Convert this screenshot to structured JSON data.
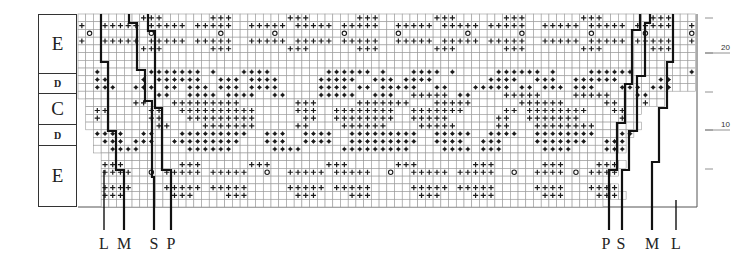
{
  "diagram": {
    "type": "knitting-chart",
    "cell_size": 7.72,
    "origin": {
      "x": 78,
      "y": 14
    },
    "colors": {
      "grid": "#9a9a9a",
      "ink": "#1a1a1a",
      "frame": "#555555"
    },
    "legend_symbols": {
      "+": "cross-stitch",
      "*": "dot-stitch",
      "o": "circle-stitch",
      ".": "empty-cell"
    },
    "sections": [
      {
        "label": "E",
        "size": "big",
        "top": 14,
        "height": 59
      },
      {
        "label": "D",
        "size": "small",
        "top": 73,
        "height": 20
      },
      {
        "label": "C",
        "size": "big",
        "top": 93,
        "height": 31
      },
      {
        "label": "D",
        "size": "small",
        "top": 124,
        "height": 21
      },
      {
        "label": "E",
        "size": "big",
        "top": 145,
        "height": 62,
        "last": true
      }
    ],
    "row_numbers": [
      {
        "label": "20",
        "y": 53
      },
      {
        "label": "10",
        "y": 130
      }
    ],
    "row_ticks": [
      18,
      53,
      92,
      130,
      169
    ],
    "size_markers_left": [
      {
        "label": "L",
        "x": 104
      },
      {
        "label": "M",
        "x": 124
      },
      {
        "label": "S",
        "x": 154
      },
      {
        "label": "P",
        "x": 171
      }
    ],
    "size_markers_right": [
      {
        "label": "P",
        "x": 606
      },
      {
        "label": "S",
        "x": 621
      },
      {
        "label": "M",
        "x": 652
      },
      {
        "label": "L",
        "x": 676
      }
    ],
    "rows": [
      {
        "start": 0,
        "cells": "........+++......+++.......+++......+++.......+++......+++.......+++......+++....."
      },
      {
        "start": 0,
        "cells": "+..+++++.+++++.+++++..+++++.+++++.+++++..+++++.+++++.+++++..+++++.+++++.+++++..+."
      },
      {
        "start": 0,
        "cells": ".o.......o........o......o........o......o........o......o........o......o.....o."
      },
      {
        "start": 0,
        "cells": "+..+++++.+++++.+++++..+++++.+++++.+++++..+++++.+++++.+++++..+++++.+++++.+++++..+."
      },
      {
        "start": 0,
        "cells": "........+++......+++.......+++......+++.......+++......+++.......+++......+++....."
      },
      {
        "start": 0,
        "cells": "................................................................................"
      },
      {
        "start": 0,
        "cells": "................................................................................"
      },
      {
        "start": 0,
        "cells": "..*......*******.*...****.......******.*...****.*.....******.*....******.......*."
      },
      {
        "start": 0,
        "cells": "..**....*.******..***.****.....*****..***.****.......****..***..******.....**...*"
      },
      {
        "start": 0,
        "cells": "..***..***.**.***.***.****.....****.**.*****..**...*****.**.***.***...***.***..."
      },
      {
        "start": 0,
        "cells": "..........**..****.****..**....*****..***..+++++.**....+++++....+++++...**.."
      },
      {
        "start": 1,
        "cells": "......++...+++++++++.......+++.....+++++++...+++++......++++++.....++...+.."
      },
      {
        "start": 1,
        "cells": ".++.....++..++++++++++.....+++..++++++++..+++++++.....++.++++++++...++.."
      },
      {
        "start": 1,
        "cells": ".+......++...+++++++++......++..++++++++..+++++......++..+++++++.....+."
      },
      {
        "start": 1,
        "cells": ".........++....+++++++.....++....++++++....+++++.....++...++++++++......"
      },
      {
        "start": 2,
        "cells": "****..**...*********..***..****..*********..*****..****..********...**"
      },
      {
        "start": 2,
        "cells": ".***.***..*********...***..****..*********..****..***....*******..***"
      },
      {
        "start": 2,
        "cells": "..****......******.....****.....*********....****.***.....****....***"
      },
      {
        "start": 3,
        "cells": "................................................................."
      },
      {
        "start": 3,
        "cells": "+++.......+++......+++.......+++......+++.......+++......+++....+++."
      },
      {
        "start": 3,
        "cells": "++++..o.+++++.+++++..o..+++++.+++++..o..+++++.+++++..o..++++.o.++++"
      },
      {
        "start": 3,
        "cells": "................................................................."
      },
      {
        "start": 3,
        "cells": "++++....+++++.+++++.....+++++.+++++.....+++++.+++++.....++++...++++"
      },
      {
        "start": 3,
        "cells": "+++......+++....+++......+++....+++......+++....+++......+++....+++."
      },
      {
        "start": 3,
        "cells": "................................................................."
      }
    ],
    "frame": {
      "x1": 78,
      "y1": 14,
      "x2": 697,
      "y2": 207,
      "bottom_right_y": 207
    },
    "size_lines": [
      {
        "points": [
          [
            101,
            14
          ],
          [
            101,
            62
          ],
          [
            108,
            62
          ],
          [
            108,
            131
          ],
          [
            116,
            131
          ],
          [
            116,
            170
          ],
          [
            124,
            170
          ],
          [
            124,
            230
          ]
        ],
        "width": 2.2,
        "ext_label": "M"
      },
      {
        "points": [
          [
            129,
            14
          ],
          [
            129,
            23
          ],
          [
            137,
            23
          ],
          [
            137,
            70
          ],
          [
            145,
            70
          ],
          [
            145,
            101
          ],
          [
            152,
            101
          ],
          [
            152,
            177
          ],
          [
            154,
            177
          ],
          [
            154,
            230
          ]
        ],
        "width": 2.2
      },
      {
        "points": [
          [
            148,
            14
          ],
          [
            148,
            31
          ],
          [
            155,
            31
          ],
          [
            155,
            108
          ],
          [
            162,
            108
          ],
          [
            162,
            170
          ],
          [
            171,
            170
          ],
          [
            171,
            230
          ]
        ],
        "width": 2.2
      },
      {
        "points": [
          [
            104,
            170
          ],
          [
            104,
            230
          ]
        ],
        "width": 1.4
      },
      {
        "points": [
          [
            609,
            230
          ],
          [
            609,
            170
          ],
          [
            617,
            170
          ],
          [
            617,
            123
          ],
          [
            625,
            123
          ],
          [
            625,
            84
          ],
          [
            632,
            84
          ],
          [
            632,
            30
          ],
          [
            640,
            30
          ],
          [
            640,
            14
          ]
        ],
        "width": 2.2
      },
      {
        "points": [
          [
            622,
            230
          ],
          [
            622,
            170
          ],
          [
            629,
            170
          ],
          [
            629,
            131
          ],
          [
            637,
            131
          ],
          [
            637,
            76
          ],
          [
            645,
            76
          ],
          [
            645,
            23
          ],
          [
            650,
            23
          ],
          [
            650,
            14
          ]
        ],
        "width": 2.2
      },
      {
        "points": [
          [
            652,
            230
          ],
          [
            652,
            162
          ],
          [
            659,
            162
          ],
          [
            659,
            108
          ],
          [
            667,
            108
          ],
          [
            667,
            62
          ],
          [
            673,
            62
          ],
          [
            673,
            14
          ]
        ],
        "width": 2.2
      },
      {
        "points": [
          [
            676,
            200
          ],
          [
            676,
            230
          ]
        ],
        "width": 1.4
      }
    ]
  }
}
